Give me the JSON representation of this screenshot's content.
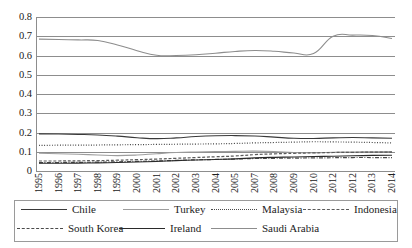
{
  "chart_data": {
    "type": "line",
    "title": "",
    "xlabel": "",
    "ylabel": "",
    "ylim": [
      0,
      0.8
    ],
    "ytick_labels": [
      "0.8",
      "0.7",
      "0.6",
      "0.5",
      "0.4",
      "0.3",
      "0.2",
      "0.1",
      "0"
    ],
    "ytick_values": [
      0.8,
      0.7,
      0.6,
      0.5,
      0.4,
      0.3,
      0.2,
      0.1,
      0
    ],
    "grid": true,
    "legend_position": "bottom",
    "x": [
      "1995",
      "1996",
      "1997",
      "1998",
      "1999",
      "2000",
      "2001",
      "2002",
      "2003",
      "2004",
      "2005",
      "2007",
      "2008",
      "2009",
      "2010",
      "2012",
      "2012",
      "2013",
      "2014"
    ],
    "series": [
      {
        "name": "Saudi Arabia",
        "style": "solid",
        "color": "#8d8d8d",
        "values": [
          0.685,
          0.683,
          0.681,
          0.678,
          0.655,
          0.625,
          0.601,
          0.6,
          0.604,
          0.612,
          0.621,
          0.626,
          0.622,
          0.613,
          0.61,
          0.7,
          0.706,
          0.704,
          0.688
        ]
      },
      {
        "name": "Chile",
        "style": "solid",
        "color": "#3a3a3a",
        "values": [
          0.193,
          0.192,
          0.19,
          0.187,
          0.181,
          0.173,
          0.168,
          0.172,
          0.179,
          0.183,
          0.184,
          0.182,
          0.176,
          0.17,
          0.169,
          0.172,
          0.174,
          0.172,
          0.17
        ]
      },
      {
        "name": "Turkey",
        "style": "solid-light",
        "color": "#9d9d9d",
        "values": [
          0.092,
          0.09,
          0.087,
          0.083,
          0.08,
          0.083,
          0.09,
          0.096,
          0.099,
          0.101,
          0.102,
          0.103,
          0.101,
          0.096,
          0.095,
          0.097,
          0.099,
          0.1,
          0.101
        ]
      },
      {
        "name": "Malaysia",
        "style": "dotted",
        "color": "#4a4a4a",
        "values": [
          0.133,
          0.134,
          0.134,
          0.135,
          0.136,
          0.137,
          0.138,
          0.139,
          0.14,
          0.141,
          0.143,
          0.146,
          0.148,
          0.15,
          0.152,
          0.151,
          0.15,
          0.148,
          0.146
        ]
      },
      {
        "name": "Indonesia",
        "style": "dashed",
        "color": "#5a5a5a",
        "values": [
          0.052,
          0.052,
          0.053,
          0.054,
          0.056,
          0.059,
          0.062,
          0.066,
          0.07,
          0.074,
          0.078,
          0.085,
          0.089,
          0.092,
          0.094,
          0.096,
          0.097,
          0.098,
          0.098
        ]
      },
      {
        "name": "South Korea",
        "style": "dash-dot",
        "color": "#4a4a4a",
        "values": [
          0.044,
          0.044,
          0.045,
          0.046,
          0.048,
          0.05,
          0.052,
          0.055,
          0.058,
          0.06,
          0.062,
          0.065,
          0.066,
          0.067,
          0.068,
          0.069,
          0.07,
          0.07,
          0.07
        ]
      },
      {
        "name": "Ireland",
        "style": "solid",
        "color": "#2a2a2a",
        "values": [
          0.04,
          0.04,
          0.041,
          0.042,
          0.044,
          0.047,
          0.05,
          0.054,
          0.057,
          0.06,
          0.063,
          0.068,
          0.071,
          0.073,
          0.075,
          0.077,
          0.079,
          0.081,
          0.082
        ]
      }
    ]
  },
  "legend": {
    "rows": [
      [
        {
          "label": "Chile",
          "style": "solid",
          "color": "#3a3a3a"
        },
        {
          "label": "Turkey",
          "style": "solid-light",
          "color": "#9d9d9d"
        },
        {
          "label": "Malaysia",
          "style": "dotted",
          "color": "#4a4a4a"
        },
        {
          "label": "Indonesia",
          "style": "dashed",
          "color": "#5a5a5a"
        }
      ],
      [
        {
          "label": "South Korea",
          "style": "dash-dot",
          "color": "#4a4a4a"
        },
        {
          "label": "Ireland",
          "style": "solid",
          "color": "#2a2a2a"
        },
        {
          "label": "Saudi Arabia",
          "style": "solid",
          "color": "#8d8d8d"
        }
      ]
    ]
  }
}
